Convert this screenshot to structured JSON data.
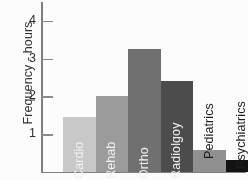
{
  "chart_data": {
    "type": "bar",
    "title": "",
    "xlabel": "",
    "ylabel": "Frequency - hours",
    "ylim": [
      0,
      4.5
    ],
    "yticks": [
      1,
      2,
      3,
      4
    ],
    "ytick_labels": [
      "1",
      "2",
      "3",
      "4"
    ],
    "grid": false,
    "legend": "none",
    "categories": [
      "Cardio",
      "Rehab",
      "Ortho",
      "Radiolgoy",
      "Pediatrics",
      "Psychiatrics"
    ],
    "values": [
      1.45,
      2.0,
      3.25,
      2.4,
      0.58,
      0.32
    ],
    "bar_colors": [
      "#c8c8c8",
      "#9a9a9a",
      "#6e6e6e",
      "#4a4a4a",
      "#8f8f8f",
      "#0f0f0f"
    ],
    "label_placement": [
      "inside",
      "inside",
      "inside",
      "inside",
      "outside",
      "outside"
    ],
    "label_colors": [
      "#f2f2f2",
      "#f2f2f2",
      "#f2f2f2",
      "#f2f2f2",
      "#1a1a1a",
      "#1a1a1a"
    ],
    "axis_color": "#7d7d7d"
  }
}
